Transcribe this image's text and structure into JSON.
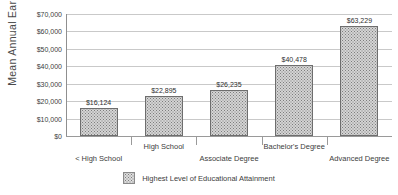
{
  "chart_data": {
    "type": "bar",
    "title": "",
    "xlabel": "Highest Level of Educational Attainment",
    "ylabel": "Mean Annual Earnings",
    "categories": [
      "< High School",
      "High School",
      "Associate Degree",
      "Bachelor's Degree",
      "Advanced Degree"
    ],
    "values": [
      16124,
      22895,
      26235,
      40478,
      63229
    ],
    "value_labels": [
      "$16,124",
      "$22,895",
      "$26,235",
      "$40,478",
      "$63,229"
    ],
    "ylim": [
      0,
      70000
    ],
    "ytick_labels": [
      "$70,000",
      "$60,000",
      "$50,000",
      "$40,000",
      "$30,000",
      "$20,000",
      "$10,000",
      "$0"
    ],
    "ytick_values": [
      70000,
      60000,
      50000,
      40000,
      30000,
      20000,
      10000,
      0
    ],
    "grid": true,
    "legend_position": "bottom",
    "legend": [
      {
        "label": "Highest Level of Educational Attainment",
        "swatch": "dotted-gray"
      }
    ],
    "colors": {
      "bar_fill": "#d4d4d4",
      "bar_pattern": "#7d7d7d",
      "bar_border": "#6e6e6e",
      "gridline": "#c9c9c9",
      "axis_line": "#8f8f8f",
      "text": "#3d3d3d",
      "background": "#ffffff"
    }
  }
}
